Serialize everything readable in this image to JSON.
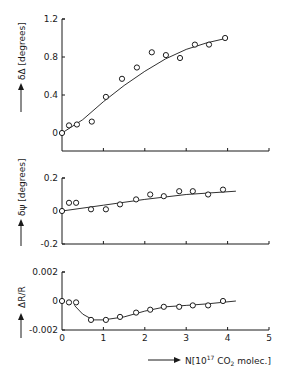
{
  "chart_data": [
    {
      "type": "scatter",
      "title": "",
      "xlabel": "N [10^17 CO2 molec.]",
      "ylabel": "δΔ [degrees]",
      "ylim": [
        -0.19,
        1.2
      ],
      "xlim": [
        0,
        5
      ],
      "yticks": [
        0,
        0.4,
        0.8,
        1.2
      ],
      "ytick_labels": [
        "0",
        "0.4",
        "0.8",
        "1.2"
      ],
      "grid": false,
      "fit_line": true,
      "x": [
        0,
        0.17,
        0.36,
        0.72,
        1.06,
        1.45,
        1.81,
        2.17,
        2.51,
        2.85,
        3.21,
        3.55,
        3.94
      ],
      "y": [
        0,
        0.08,
        0.09,
        0.12,
        0.38,
        0.57,
        0.69,
        0.85,
        0.82,
        0.79,
        0.93,
        0.93,
        1.0
      ],
      "fit_x": [
        0,
        0.5,
        1.0,
        1.5,
        2.0,
        2.5,
        3.0,
        3.5,
        4.0
      ],
      "fit_y": [
        0,
        0.14,
        0.33,
        0.5,
        0.65,
        0.78,
        0.88,
        0.95,
        1.0
      ]
    },
    {
      "type": "scatter",
      "title": "",
      "xlabel": "N [10^17 CO2 molec.]",
      "ylabel": "δψ [degrees]",
      "ylim": [
        -0.2,
        0.2
      ],
      "xlim": [
        0,
        5
      ],
      "yticks": [
        -0.2,
        0,
        0.2
      ],
      "ytick_labels": [
        "-0.2",
        "0",
        "0.2"
      ],
      "grid": false,
      "fit_line": true,
      "x": [
        0,
        0.17,
        0.34,
        0.7,
        1.06,
        1.4,
        1.79,
        2.13,
        2.46,
        2.83,
        3.16,
        3.53,
        3.89
      ],
      "y": [
        0,
        0.05,
        0.05,
        0.01,
        0.01,
        0.04,
        0.07,
        0.1,
        0.09,
        0.12,
        0.12,
        0.1,
        0.13
      ],
      "fit_x": [
        0,
        1.0,
        2.0,
        3.0,
        4.2
      ],
      "fit_y": [
        0,
        0.035,
        0.07,
        0.1,
        0.12
      ]
    },
    {
      "type": "scatter",
      "title": "",
      "xlabel": "N [10^17 CO2 molec.]",
      "ylabel": "ΔR/R",
      "ylim": [
        -0.002,
        0.002
      ],
      "xlim": [
        0,
        5
      ],
      "yticks": [
        -0.002,
        0,
        0.002
      ],
      "ytick_labels": [
        "-0.002",
        "0",
        "0.002"
      ],
      "xticks": [
        0,
        1,
        2,
        3,
        4,
        5
      ],
      "xtick_labels": [
        "0",
        "1",
        "2",
        "3",
        "4",
        "5"
      ],
      "grid": false,
      "fit_line": true,
      "x": [
        0,
        0.17,
        0.34,
        0.7,
        1.06,
        1.4,
        1.79,
        2.13,
        2.46,
        2.83,
        3.16,
        3.53,
        3.89
      ],
      "y": [
        0,
        -0.0001,
        -0.0001,
        -0.0013,
        -0.0013,
        -0.0011,
        -0.0008,
        -0.0006,
        -0.0004,
        -0.0004,
        -0.0003,
        -0.0003,
        0.0
      ],
      "fit_x": [
        0.3,
        0.5,
        0.75,
        1.0,
        1.5,
        2.0,
        2.5,
        3.0,
        3.5,
        4.2
      ],
      "fit_y": [
        -0.0003,
        -0.0009,
        -0.0013,
        -0.0013,
        -0.0011,
        -0.0007,
        -0.0004,
        -0.0003,
        -0.0002,
        0.0
      ]
    }
  ],
  "labels": {
    "panel1_ylabel": "δΔ [degrees]",
    "panel2_ylabel": "δψ [degrees]",
    "panel3_ylabel": "ΔR/R",
    "xlabel_prefix": "N[10",
    "xlabel_exp": "17",
    "xlabel_mid": " CO",
    "xlabel_sub": "2",
    "xlabel_suffix": " molec.]"
  },
  "style": {
    "ink": "#1a1a1a",
    "background": "#ffffff"
  }
}
